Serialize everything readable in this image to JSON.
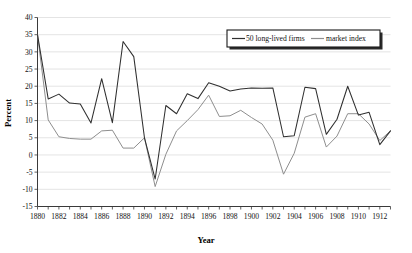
{
  "chart_data": {
    "type": "line",
    "title": "",
    "xlabel": "Year",
    "ylabel": "Percent",
    "xlim": [
      1880,
      1913
    ],
    "ylim": [
      -15,
      40
    ],
    "ytick_step": 5,
    "xtick_step": 1,
    "xticklabel_step": 2,
    "grid": true,
    "legend_position": "top-right",
    "x": [
      1880,
      1881,
      1882,
      1883,
      1884,
      1885,
      1886,
      1887,
      1888,
      1889,
      1890,
      1891,
      1892,
      1893,
      1894,
      1895,
      1896,
      1897,
      1898,
      1899,
      1900,
      1901,
      1902,
      1903,
      1904,
      1905,
      1906,
      1907,
      1908,
      1909,
      1910,
      1911,
      1912,
      1913
    ],
    "xticklabels": [
      "1880",
      "1882",
      "1884",
      "1886",
      "1888",
      "1890",
      "1892",
      "1894",
      "1896",
      "1898",
      "1900",
      "1902",
      "1904",
      "1906",
      "1908",
      "1910",
      "1912"
    ],
    "yticklabels": [
      "-15",
      "-10",
      "-5",
      "0",
      "5",
      "10",
      "15",
      "20",
      "25",
      "30",
      "35",
      "40"
    ],
    "series": [
      {
        "name": "50 long-lived firms",
        "color": "#2f2f2f",
        "values": [
          35.0,
          16.3,
          17.7,
          15.1,
          14.8,
          9.3,
          22.2,
          9.4,
          33.0,
          28.6,
          5.0,
          -7.0,
          14.4,
          12.0,
          17.8,
          16.4,
          21.0,
          20.0,
          18.6,
          19.2,
          19.5,
          19.4,
          19.5,
          5.3,
          5.6,
          19.7,
          19.3,
          6.0,
          10.4,
          20.0,
          11.6,
          12.4,
          3.0,
          7.0
        ]
      },
      {
        "name": "market index",
        "color": "#8e8e8e",
        "values": [
          35.0,
          10.2,
          5.3,
          4.8,
          4.6,
          4.6,
          7.0,
          7.2,
          2.0,
          2.0,
          5.0,
          -9.2,
          0.2,
          7.0,
          10.0,
          13.2,
          17.4,
          11.2,
          11.4,
          13.0,
          10.9,
          9.0,
          4.3,
          -5.6,
          0.5,
          11.0,
          12.0,
          2.3,
          5.5,
          12.0,
          12.0,
          9.0,
          4.2,
          7.0
        ]
      }
    ]
  },
  "legend": {
    "items": [
      {
        "label": "50 long-lived firms"
      },
      {
        "label": "market index"
      }
    ]
  },
  "axes": {
    "x_title": "Year",
    "y_title": "Percent"
  }
}
